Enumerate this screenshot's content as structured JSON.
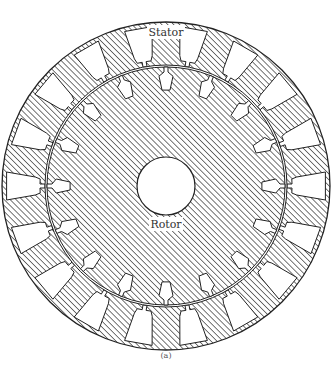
{
  "figure": {
    "caption": "(a)",
    "labels": {
      "stator": "Stator",
      "rotor": "Rotor"
    },
    "colors": {
      "outline": "#222222",
      "hatch": "#555555",
      "background": "#ffffff",
      "text": "#333333"
    },
    "geometry": {
      "center": [
        166,
        186
      ],
      "stator_outer_radius": 166,
      "stator_inner_radius": 121,
      "rotor_outer_radius": 119,
      "shaft_radius": 29,
      "stator_slot_count": 18,
      "rotor_slot_count": 16
    }
  }
}
